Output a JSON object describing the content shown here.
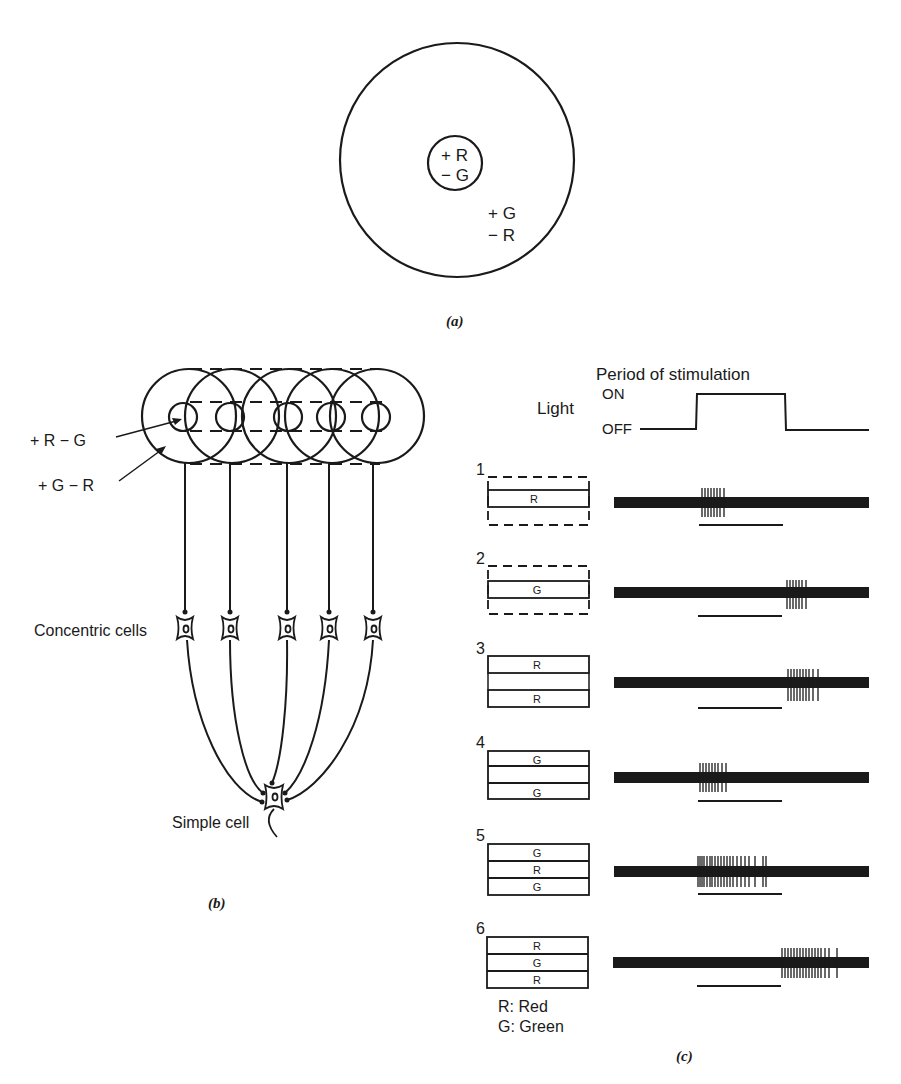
{
  "panel_a": {
    "caption": "(a)",
    "center_labels": [
      "+ R",
      "− G"
    ],
    "surround_labels": [
      "+ G",
      "− R"
    ]
  },
  "panel_b": {
    "caption": "(b)",
    "label_center": "+ R − G",
    "label_surround": "+ G − R",
    "label_concentric": "Concentric cells",
    "label_simple": "Simple cell",
    "receptive_field_count": 5
  },
  "panel_c": {
    "caption": "(c)",
    "light_label": "Light",
    "on_label": "ON",
    "off_label": "OFF",
    "period_label": "Period of stimulation",
    "legend": [
      "R:  Red",
      "G:  Green"
    ],
    "trials": [
      {
        "number": "1",
        "bars": [
          "",
          "R",
          ""
        ],
        "dashed_outer": true,
        "bars_visible": [
          false,
          true,
          false
        ],
        "burst": "on",
        "burst_desc": "burst at light onset"
      },
      {
        "number": "2",
        "bars": [
          "",
          "G",
          ""
        ],
        "dashed_outer": true,
        "bars_visible": [
          false,
          true,
          false
        ],
        "burst": "off",
        "burst_desc": "burst at light offset"
      },
      {
        "number": "3",
        "bars": [
          "R",
          "",
          "R"
        ],
        "dashed_outer": false,
        "bars_visible": [
          true,
          false,
          true
        ],
        "burst": "off",
        "burst_desc": "burst at light offset"
      },
      {
        "number": "4",
        "bars": [
          "G",
          "",
          "G"
        ],
        "dashed_outer": false,
        "bars_visible": [
          true,
          true,
          true
        ],
        "burst": "on",
        "burst_desc": "burst at light onset"
      },
      {
        "number": "5",
        "bars": [
          "G",
          "R",
          "G"
        ],
        "dashed_outer": false,
        "bars_visible": [
          true,
          true,
          true
        ],
        "burst": "sustained",
        "burst_desc": "strong response throughout stimulation"
      },
      {
        "number": "6",
        "bars": [
          "R",
          "G",
          "R"
        ],
        "dashed_outer": false,
        "bars_visible": [
          true,
          true,
          true
        ],
        "burst": "off-strong",
        "burst_desc": "strong burst at light offset"
      }
    ]
  },
  "colors": {
    "ink": "#1a1a1a",
    "background": "#ffffff"
  }
}
